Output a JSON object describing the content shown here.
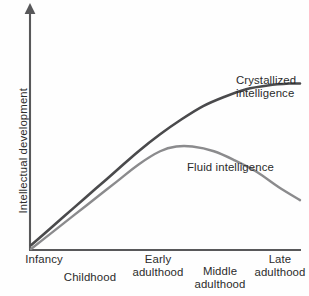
{
  "chart_data": {
    "type": "line",
    "title": "",
    "xlabel": "",
    "ylabel": "Intellectual development",
    "grid": false,
    "legend_position": "inline-annotations",
    "x_tick_labels": [
      "Infancy",
      "Childhood",
      "Early\nadulthood",
      "Middle\nadulthood",
      "Late\nadulthood"
    ],
    "x_tick_positions": [
      0.0,
      0.2,
      0.45,
      0.68,
      0.92
    ],
    "xlim": [
      0,
      1
    ],
    "ylim": [
      0,
      1
    ],
    "y_tick_labels": [],
    "series": [
      {
        "name": "Crystallized intelligence",
        "color": "#4a4a4c",
        "annotation": "Crystallized\nintelligence",
        "x": [
          0.0,
          0.08,
          0.16,
          0.24,
          0.32,
          0.4,
          0.48,
          0.56,
          0.64,
          0.72,
          0.8,
          0.88,
          0.96,
          1.0
        ],
        "y": [
          0.02,
          0.12,
          0.22,
          0.32,
          0.42,
          0.52,
          0.61,
          0.69,
          0.76,
          0.81,
          0.85,
          0.87,
          0.88,
          0.88
        ]
      },
      {
        "name": "Fluid intelligence",
        "color": "#8b8b8d",
        "annotation": "Fluid intelligence",
        "x": [
          0.0,
          0.08,
          0.16,
          0.24,
          0.32,
          0.4,
          0.48,
          0.54,
          0.6,
          0.68,
          0.76,
          0.84,
          0.92,
          1.0
        ],
        "y": [
          0.0,
          0.09,
          0.18,
          0.27,
          0.36,
          0.45,
          0.52,
          0.545,
          0.545,
          0.52,
          0.47,
          0.41,
          0.33,
          0.26
        ]
      }
    ]
  },
  "axes": {
    "y_axis_label": "Intellectual development",
    "y_axis_has_arrow": true,
    "axis_color": "#58585a"
  },
  "annotations": {
    "crystallized_line1": "Crystallized",
    "crystallized_line2": "intelligence",
    "fluid": "Fluid intelligence"
  },
  "x_labels": {
    "infancy": "Infancy",
    "childhood": "Childhood",
    "early_line1": "Early",
    "early_line2": "adulthood",
    "middle_line1": "Middle",
    "middle_line2": "adulthood",
    "late_line1": "Late",
    "late_line2": "adulthood"
  }
}
